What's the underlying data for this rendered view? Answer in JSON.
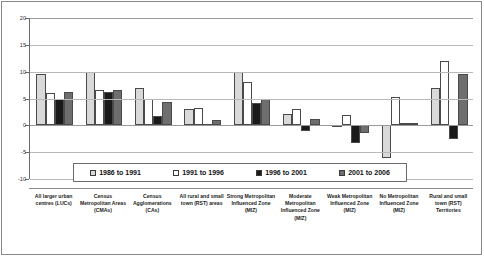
{
  "chart_data": {
    "type": "bar",
    "title": "",
    "subtitle": "",
    "xlabel": "",
    "ylabel": "",
    "ylim": [
      -10,
      20
    ],
    "yticks": [
      20,
      15,
      10,
      5,
      0,
      -5,
      -10
    ],
    "ytick_labels": [
      "20",
      "15",
      "10",
      "5",
      "0",
      "-5",
      "-10"
    ],
    "grid": true,
    "legend_position": "bottom-inside",
    "categories": [
      "All larger urban centres (LUCs)",
      "Census Metropolitan Areas (CMAs)",
      "Census Agglomerations (CAs)",
      "All rural and small town (RST) areas",
      "Strong Metropolitan Influenced Zone (MIZ)",
      "Moderate Metropolitan Influenced Zone (MIZ)",
      "Weak Metropolitan Influenced Zone (MIZ)",
      "No Metropolitan Influenced Zone (MIZ)",
      "Rural and small town (RST) Territories"
    ],
    "series": [
      {
        "name": "1986 to 1991",
        "color": "#d9d9d9",
        "values": [
          9.5,
          10.0,
          7.0,
          3.0,
          10.0,
          2.2,
          -0.3,
          -6.0,
          7.0
        ]
      },
      {
        "name": "1991 to 1996",
        "color": "#ffffff",
        "values": [
          6.0,
          6.5,
          5.0,
          3.3,
          8.0,
          3.0,
          2.0,
          5.3,
          12.0
        ]
      },
      {
        "name": "1996 to 2001",
        "color": "#1a1a1a",
        "values": [
          5.0,
          6.3,
          1.8,
          0.2,
          4.2,
          -1.0,
          -3.3,
          0.5,
          -2.5
        ]
      },
      {
        "name": "2001 to 2006",
        "color": "#6e6e6e",
        "values": [
          6.3,
          6.5,
          4.3,
          1.0,
          5.0,
          1.2,
          -1.5,
          0.5,
          9.5
        ]
      }
    ]
  },
  "legend": {
    "items": [
      {
        "label": "1986 to 1991"
      },
      {
        "label": "1991 to 1996"
      },
      {
        "label": "1996 to 2001"
      },
      {
        "label": "2001 to 2006"
      }
    ]
  }
}
